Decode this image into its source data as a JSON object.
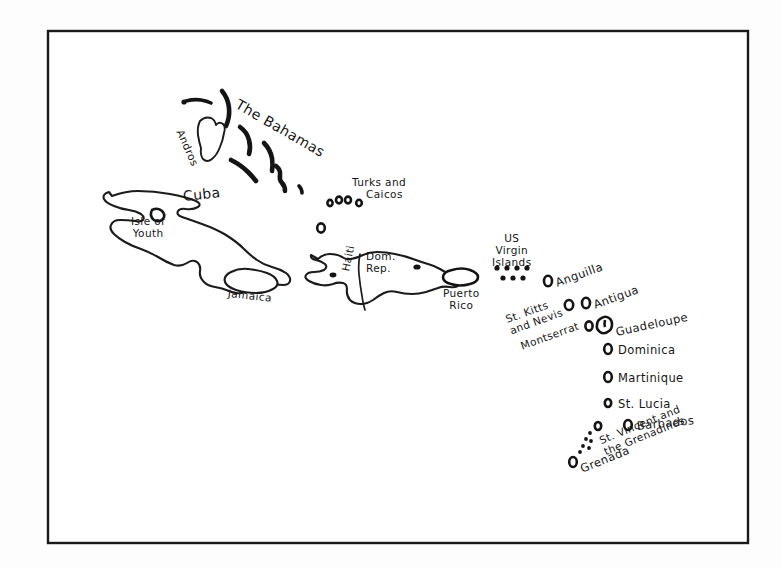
{
  "document": {
    "kind": "hand-drawn-map",
    "region_title": "Caribbean",
    "background_color": "#ffffff",
    "ink_color": "#161616",
    "frame": {
      "x": 48,
      "y": 31,
      "width": 700,
      "height": 512,
      "stroke_color": "#1a1a1a"
    }
  },
  "labels": {
    "the_bahamas": "The Bahamas",
    "andros": "Andros",
    "cuba": "Cuba",
    "isle_of_youth": "Isle of\nYouth",
    "isle_of_youth_line1": "Isle of",
    "isle_of_youth_line2": "Youth",
    "jamaica": "Jamaica",
    "turks_and_caicos_line1": "Turks and",
    "turks_and_caicos_line2": "Caicos",
    "haiti": "Haiti",
    "dom_rep_line1": "Dom.",
    "dom_rep_line2": "Rep.",
    "puerto_rico_line1": "Puerto",
    "puerto_rico_line2": "Rico",
    "us_virgin_islands_line1": "US",
    "us_virgin_islands_line2": "Virgin",
    "us_virgin_islands_line3": "Islands",
    "anguilla": "Anguilla",
    "st_kitts_and_nevis_line1": "St. Kitts",
    "st_kitts_and_nevis_line2": "and Nevis",
    "antigua": "Antigua",
    "montserrat": "Montserrat",
    "guadeloupe": "Guadeloupe",
    "dominica": "Dominica",
    "martinique": "Martinique",
    "st_lucia": "St. Lucia",
    "barbados": "Barbados",
    "st_vincent_line1": "St. Vincent and",
    "st_vincent_line2": "the Grenadines",
    "grenada": "Grenada"
  },
  "places": [
    {
      "id": "the-bahamas",
      "name": "The Bahamas",
      "type": "archipelago-label"
    },
    {
      "id": "andros",
      "name": "Andros",
      "type": "island"
    },
    {
      "id": "cuba",
      "name": "Cuba",
      "type": "island"
    },
    {
      "id": "isle-of-youth",
      "name": "Isle of Youth",
      "type": "island"
    },
    {
      "id": "jamaica",
      "name": "Jamaica",
      "type": "island"
    },
    {
      "id": "turks-and-caicos",
      "name": "Turks and Caicos",
      "type": "archipelago"
    },
    {
      "id": "haiti",
      "name": "Haiti",
      "type": "country"
    },
    {
      "id": "dominican-republic",
      "name": "Dom. Rep.",
      "type": "country"
    },
    {
      "id": "puerto-rico",
      "name": "Puerto Rico",
      "type": "island"
    },
    {
      "id": "us-virgin-islands",
      "name": "US Virgin Islands",
      "type": "archipelago"
    },
    {
      "id": "anguilla",
      "name": "Anguilla",
      "type": "island"
    },
    {
      "id": "st-kitts-and-nevis",
      "name": "St. Kitts and Nevis",
      "type": "island"
    },
    {
      "id": "antigua",
      "name": "Antigua",
      "type": "island"
    },
    {
      "id": "montserrat",
      "name": "Montserrat",
      "type": "island"
    },
    {
      "id": "guadeloupe",
      "name": "Guadeloupe",
      "type": "island"
    },
    {
      "id": "dominica",
      "name": "Dominica",
      "type": "island"
    },
    {
      "id": "martinique",
      "name": "Martinique",
      "type": "island"
    },
    {
      "id": "st-lucia",
      "name": "St. Lucia",
      "type": "island"
    },
    {
      "id": "barbados",
      "name": "Barbados",
      "type": "island"
    },
    {
      "id": "st-vincent-and-the-grenadines",
      "name": "St. Vincent and the Grenadines",
      "type": "island"
    },
    {
      "id": "grenada",
      "name": "Grenada",
      "type": "island"
    }
  ]
}
